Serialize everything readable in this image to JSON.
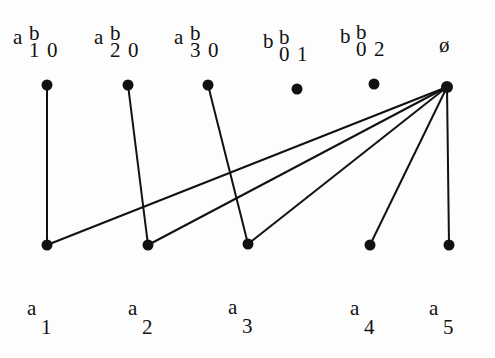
{
  "diagram": {
    "type": "bipartite-graph",
    "colors": {
      "ink": "#111111",
      "paper": "#fdfdfd",
      "show_through": "#e6e6e6"
    },
    "top_nodes": [
      {
        "id": "a1b0",
        "main": "a b",
        "sub": "1 0",
        "x": 47,
        "y": 85
      },
      {
        "id": "a2b0",
        "main": "a b",
        "sub": "2 0",
        "x": 128,
        "y": 85
      },
      {
        "id": "a3b0",
        "main": "a b",
        "sub": "3 0",
        "x": 208,
        "y": 85
      },
      {
        "id": "b0b1",
        "main": "b b",
        "sub": "0 1",
        "x": 297,
        "y": 89
      },
      {
        "id": "b0b2",
        "main": "b b",
        "sub": "0 2",
        "x": 374,
        "y": 84
      },
      {
        "id": "empty",
        "main": "ø",
        "sub": "",
        "x": 447,
        "y": 87
      }
    ],
    "bottom_nodes": [
      {
        "id": "a1",
        "main": "a",
        "sub": "1",
        "x": 47,
        "y": 245
      },
      {
        "id": "a2",
        "main": "a",
        "sub": "2",
        "x": 148,
        "y": 245
      },
      {
        "id": "a3",
        "main": "a",
        "sub": "3",
        "x": 248,
        "y": 244
      },
      {
        "id": "a4",
        "main": "a",
        "sub": "4",
        "x": 370,
        "y": 245
      },
      {
        "id": "a5",
        "main": "a",
        "sub": "5",
        "x": 449,
        "y": 245
      }
    ],
    "edges": [
      [
        "a1b0",
        "a1"
      ],
      [
        "a2b0",
        "a2"
      ],
      [
        "a3b0",
        "a3"
      ],
      [
        "empty",
        "a1"
      ],
      [
        "empty",
        "a2"
      ],
      [
        "empty",
        "a3"
      ],
      [
        "empty",
        "a4"
      ],
      [
        "empty",
        "a5"
      ]
    ]
  }
}
